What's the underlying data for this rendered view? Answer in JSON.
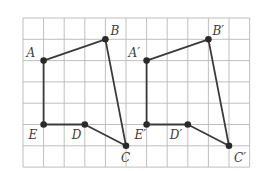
{
  "diagram": {
    "type": "grid-translation",
    "grid": {
      "cols": 11,
      "rows": 7,
      "origin_x": 23,
      "origin_y": 18,
      "cell_w": 20.6,
      "cell_h": 21.3
    },
    "figures": [
      {
        "name": "original",
        "points": [
          {
            "label": "A",
            "col": 1,
            "row": 2,
            "label_dx": -17,
            "label_dy": -4
          },
          {
            "label": "B",
            "col": 4,
            "row": 1,
            "label_dx": 5,
            "label_dy": -4
          },
          {
            "label": "C",
            "col": 5,
            "row": 6,
            "label_dx": -5,
            "label_dy": 16
          },
          {
            "label": "D",
            "col": 3,
            "row": 5,
            "label_dx": -13,
            "label_dy": 14
          },
          {
            "label": "E",
            "col": 1,
            "row": 5,
            "label_dx": -15,
            "label_dy": 14
          }
        ],
        "edges": [
          [
            "E",
            "A"
          ],
          [
            "A",
            "B"
          ],
          [
            "B",
            "C"
          ],
          [
            "C",
            "D"
          ],
          [
            "D",
            "E"
          ]
        ]
      },
      {
        "name": "image",
        "points": [
          {
            "label": "A′",
            "col": 6,
            "row": 2,
            "label_dx": -18,
            "label_dy": -4
          },
          {
            "label": "B′",
            "col": 9,
            "row": 1,
            "label_dx": 4,
            "label_dy": -4
          },
          {
            "label": "C′",
            "col": 10,
            "row": 6,
            "label_dx": 5,
            "label_dy": 16
          },
          {
            "label": "D′",
            "col": 8,
            "row": 5,
            "label_dx": -18,
            "label_dy": 14
          },
          {
            "label": "E′",
            "col": 6,
            "row": 5,
            "label_dx": -12,
            "label_dy": 14
          }
        ],
        "edges": [
          [
            "E′",
            "A′"
          ],
          [
            "A′",
            "B′"
          ],
          [
            "B′",
            "C′"
          ],
          [
            "C′",
            "D′"
          ],
          [
            "D′",
            "E′"
          ]
        ]
      }
    ]
  }
}
